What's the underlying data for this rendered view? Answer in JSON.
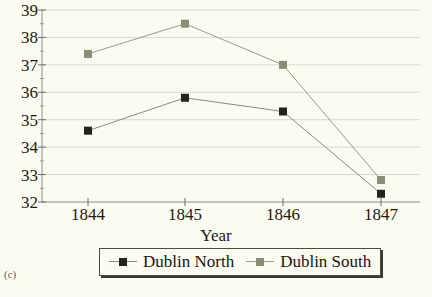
{
  "figure": {
    "panel_label": "(c)",
    "background_color": "#fbfbf2"
  },
  "chart_data": {
    "type": "line",
    "title": "",
    "xlabel": "Year",
    "ylabel": "",
    "categories": [
      "1844",
      "1845",
      "1846",
      "1847"
    ],
    "x": [
      1844,
      1845,
      1846,
      1847
    ],
    "xlim": [
      1843.5,
      1847.5
    ],
    "ylim": [
      32,
      39
    ],
    "yticks": [
      32,
      33,
      34,
      35,
      36,
      37,
      38,
      39
    ],
    "ytick_labels": [
      "32",
      "33",
      "34",
      "35",
      "36",
      "37",
      "38",
      "39"
    ],
    "minor_yticks": true,
    "grid": "horizontal",
    "grid_color": "#d9d9cc",
    "legend_position": "bottom-center",
    "series": [
      {
        "name": "Dublin North",
        "color": "#24241c",
        "marker": "square",
        "line_color": "#8a8a78",
        "values": [
          34.6,
          35.8,
          35.3,
          32.3
        ]
      },
      {
        "name": "Dublin South",
        "color": "#878f77",
        "marker": "square",
        "line_color": "#9a9a88",
        "values": [
          37.4,
          38.5,
          37.0,
          32.8
        ]
      }
    ]
  },
  "legend": {
    "entries": [
      {
        "label": "Dublin North"
      },
      {
        "label": "Dublin South"
      }
    ]
  }
}
